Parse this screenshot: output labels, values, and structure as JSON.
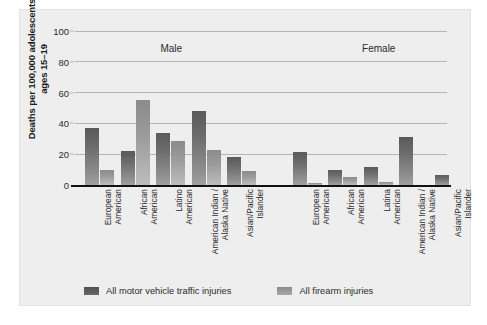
{
  "chart_data": {
    "type": "bar",
    "title": "",
    "subtitle": "",
    "xlabel": "",
    "ylabel": "Deaths per 100,000 adolescents ages 15–19",
    "ylabel_line1": "Deaths per 100,000 adolescents",
    "ylabel_line2": "ages 15–19",
    "ylim": [
      0,
      100
    ],
    "yticks": [
      0,
      20,
      40,
      60,
      80,
      100
    ],
    "ytick_labels": [
      "0",
      "20",
      "40",
      "60",
      "80",
      "100"
    ],
    "grid": true,
    "grid_axis": "y",
    "legend_position": "bottom",
    "panels": [
      {
        "name": "Male",
        "label": "Male",
        "categories": [
          "European American",
          "African American",
          "Latino American",
          "American Indian / Alaska Native",
          "Asian/Pacific Islander"
        ],
        "category_lines": [
          [
            "European",
            "American"
          ],
          [
            "African",
            "American"
          ],
          [
            "Latino",
            "American"
          ],
          [
            "American Indian /",
            "Alaska Native"
          ],
          [
            "Asian/Pacific",
            "Islander"
          ]
        ]
      },
      {
        "name": "Female",
        "label": "Female",
        "categories": [
          "European American",
          "African American",
          "Latina American",
          "American Indian / Alaska Native",
          "Asian/Pacific Islander"
        ],
        "category_lines": [
          [
            "European",
            "American"
          ],
          [
            "African",
            "American"
          ],
          [
            "Latina",
            "American"
          ],
          [
            "American Indian /",
            "Alaska Native"
          ],
          [
            "Asian/Pacific",
            "Islander"
          ]
        ]
      }
    ],
    "series": [
      {
        "name": "All motor vehicle traffic injuries",
        "color": "#5f5f5f",
        "values_male": [
          37,
          22,
          33.5,
          48,
          18.5
        ],
        "values_female": [
          21.5,
          10,
          11.5,
          31.5,
          6.5
        ]
      },
      {
        "name": "All firearm  injuries",
        "color": "#9b9b9b",
        "values_male": [
          10,
          55,
          28.5,
          22.5,
          9
        ],
        "values_female": [
          1,
          5,
          2,
          0,
          0
        ]
      }
    ],
    "legend": [
      {
        "label": "All motor vehicle traffic injuries",
        "swatch": "motor",
        "color": "#5f5f5f"
      },
      {
        "label": "All firearm  injuries",
        "swatch": "firearm",
        "color": "#9b9b9b"
      }
    ]
  }
}
